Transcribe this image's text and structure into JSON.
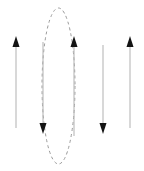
{
  "figure": {
    "width": 144,
    "height": 171,
    "background_color": "#ffffff"
  },
  "chart_data": {
    "type": "diagram",
    "xlabel": "",
    "ylabel": "",
    "xlim": [
      0,
      144
    ],
    "ylim": [
      0,
      171
    ],
    "grid": false,
    "legend": "none",
    "annotations": []
  },
  "style": {
    "line_color": "#b8b8b8",
    "line_width": 1.1,
    "arrowhead_color": "#141414",
    "ellipse_color": "#9a9a9a",
    "ellipse_width": 1.0,
    "ellipse_dash": "3 3"
  },
  "arrows": [
    {
      "id": "arrow-1",
      "label": "arrow-up-1",
      "direction": "up",
      "x": 16,
      "y_tail": 128,
      "y_head": 36,
      "length": 92,
      "head_width": 7,
      "head_length": 11
    },
    {
      "id": "arrow-2",
      "label": "arrow-down-1",
      "direction": "down",
      "x": 43,
      "y_tail": 42,
      "y_head": 134,
      "length": 92,
      "head_width": 7,
      "head_length": 11
    },
    {
      "id": "arrow-3",
      "label": "arrow-up-2",
      "direction": "up",
      "x": 74,
      "y_tail": 136,
      "y_head": 36,
      "length": 100,
      "head_width": 7,
      "head_length": 11
    },
    {
      "id": "arrow-4",
      "label": "arrow-down-2",
      "direction": "down",
      "x": 103,
      "y_tail": 45,
      "y_head": 134,
      "length": 89,
      "head_width": 7,
      "head_length": 11
    },
    {
      "id": "arrow-5",
      "label": "arrow-up-3",
      "direction": "up",
      "x": 130,
      "y_tail": 128,
      "y_head": 36,
      "length": 92,
      "head_width": 7,
      "head_length": 11
    }
  ],
  "ellipse": {
    "id": "dashed-ellipse",
    "label": "dashed elliptical contour",
    "center_x": 58.5,
    "center_y": 86,
    "radius_x": 16.5,
    "radius_y": 78,
    "dashed": true
  }
}
